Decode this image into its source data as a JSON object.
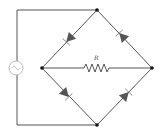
{
  "diagram": {
    "type": "bridge-rectifier-circuit",
    "components": {
      "source": {
        "kind": "ac-voltage-source",
        "symbol": "~"
      },
      "resistor": {
        "kind": "resistor",
        "label": "R"
      },
      "diodes": [
        {
          "id": "D1",
          "position": "upper-left",
          "direction": "toward-left-node"
        },
        {
          "id": "D2",
          "position": "upper-right",
          "direction": "toward-top-node"
        },
        {
          "id": "D3",
          "position": "lower-left",
          "direction": "toward-bottom-node"
        },
        {
          "id": "D4",
          "position": "lower-right",
          "direction": "toward-right-node"
        }
      ],
      "nodes": [
        "top",
        "left",
        "right",
        "bottom"
      ]
    },
    "colors": {
      "wire": "#555555",
      "node": "#111111",
      "source": "#bbbbbb"
    }
  }
}
